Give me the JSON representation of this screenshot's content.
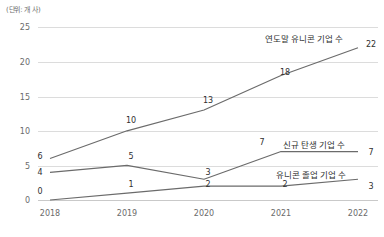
{
  "chart_data": {
    "type": "line",
    "title": "",
    "subtitle": "",
    "unit_label": "(단위: 개 사)",
    "xlabel": "",
    "ylabel": "",
    "categories": [
      "2018",
      "2019",
      "2020",
      "2021",
      "2022"
    ],
    "ylim": [
      0,
      25
    ],
    "yticks": [
      0,
      5,
      10,
      15,
      20,
      25
    ],
    "grid": true,
    "legend_position": "inline-right",
    "series": [
      {
        "name": "연도말 유니콘 기업 수",
        "values": [
          6,
          10,
          13,
          18,
          22
        ],
        "color": "#6b6b6b"
      },
      {
        "name": "신규 탄생 기업 수",
        "values": [
          4,
          5,
          3,
          7,
          7
        ],
        "color": "#6b6b6b"
      },
      {
        "name": "유니콘 졸업 기업 수",
        "values": [
          0,
          1,
          2,
          2,
          3
        ],
        "color": "#6b6b6b"
      }
    ]
  },
  "yticks": {
    "t0": "0",
    "t1": "5",
    "t2": "10",
    "t3": "15",
    "t4": "20",
    "t5": "25"
  },
  "xticks": {
    "x0": "2018",
    "x1": "2019",
    "x2": "2020",
    "x3": "2021",
    "x4": "2022"
  },
  "labels": {
    "unit": "(단위: 개 사)",
    "series_a": "연도말 유니콘 기업 수",
    "series_b": "신규 탄생 기업 수",
    "series_c": "유니콘 졸업 기업 수",
    "a0": "6",
    "a1": "10",
    "a2": "13",
    "a3": "18",
    "a4": "22",
    "b0": "4",
    "b1": "5",
    "b2": "3",
    "b3": "7",
    "b4": "7",
    "c0": "0",
    "c1": "1",
    "c2": "2",
    "c3": "2",
    "c4": "3"
  }
}
